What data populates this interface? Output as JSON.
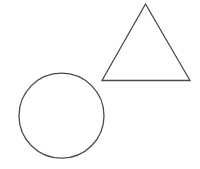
{
  "canvas": {
    "width": 200,
    "height": 169,
    "background": "#ffffff"
  },
  "style": {
    "stroke": "#4a4a4a",
    "stroke_width": 1.3,
    "fill": "none"
  },
  "shapes": {
    "triangle": {
      "points": "145.5,4 102,80.5 190,80.5"
    },
    "circle": {
      "cx": 61.5,
      "cy": 115.7,
      "r": 42.5
    }
  }
}
